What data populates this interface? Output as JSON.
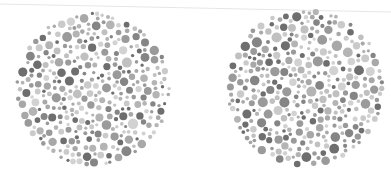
{
  "image": {
    "description": "Two grayscale Ishihara-style color-vision test plates (dot circles)",
    "background": "#ffffff"
  },
  "plates": [
    {
      "id": "left",
      "cx": 93,
      "cy": 89,
      "r": 78,
      "seed": 17
    },
    {
      "id": "right",
      "cx": 305,
      "cy": 88,
      "r": 80,
      "seed": 42
    }
  ],
  "palette": [
    "#6e6e6e",
    "#858585",
    "#9a9a9a",
    "#a8a8a8",
    "#b4b4b4",
    "#c0c0c0",
    "#cacaca",
    "#d2d2d2"
  ]
}
